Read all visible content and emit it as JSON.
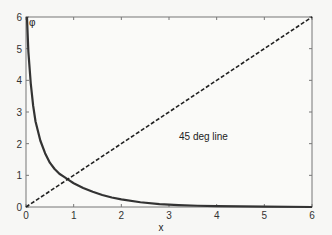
{
  "chart_data": {
    "type": "line",
    "title": "",
    "xlabel": "x",
    "ylabel": "φ",
    "xlim": [
      0,
      6
    ],
    "ylim": [
      0,
      6
    ],
    "xticks": [
      0,
      1,
      2,
      3,
      4,
      5,
      6
    ],
    "yticks": [
      0,
      1,
      2,
      3,
      4,
      5,
      6
    ],
    "grid": false,
    "legend": null,
    "annotations": [
      {
        "text": "45 deg line",
        "x": 3.0,
        "y": 2.5
      }
    ],
    "series": [
      {
        "name": "phi(x)",
        "style": "solid",
        "color": "#333333",
        "x": [
          0.02,
          0.05,
          0.1,
          0.15,
          0.2,
          0.3,
          0.4,
          0.5,
          0.6,
          0.7,
          0.8,
          0.9,
          1.0,
          1.2,
          1.4,
          1.6,
          1.8,
          2.0,
          2.4,
          2.8,
          3.2,
          3.6,
          4.0,
          5.0,
          6.0
        ],
        "values": [
          6.0,
          4.9,
          3.9,
          3.2,
          2.7,
          2.1,
          1.7,
          1.4,
          1.2,
          1.05,
          0.95,
          0.85,
          0.75,
          0.6,
          0.48,
          0.38,
          0.3,
          0.24,
          0.15,
          0.09,
          0.06,
          0.04,
          0.03,
          0.01,
          0.0
        ]
      },
      {
        "name": "45 deg line",
        "style": "dashed",
        "color": "#222222",
        "x": [
          0,
          6
        ],
        "values": [
          0,
          6
        ]
      }
    ]
  }
}
